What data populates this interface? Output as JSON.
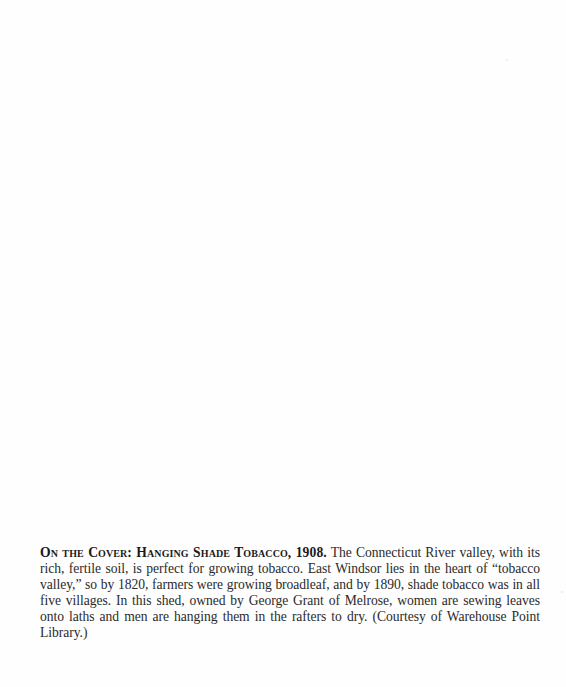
{
  "page": {
    "caption": {
      "lead": "On the Cover: Hanging Shade Tobacco, 1908.",
      "body": " The Connecticut River valley, with its rich, fertile soil, is perfect for growing tobacco. East Windsor lies in the heart of “tobacco valley,” so by 1820, farmers were growing broadleaf, and by 1890, shade tobacco was in all five villages. In this shed, owned by George Grant of Melrose, women are sewing leaves onto laths and men are hanging them in the rafters to dry. (Courtesy of Warehouse Point Library.)"
    }
  }
}
